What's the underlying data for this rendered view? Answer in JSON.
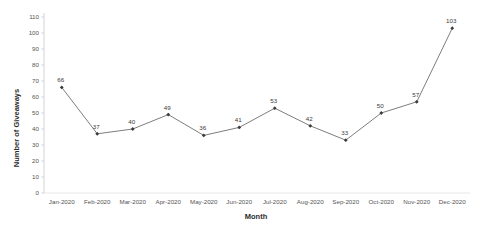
{
  "chart_data": {
    "type": "line",
    "title": "",
    "xlabel": "Month",
    "ylabel": "Number of Giveaways",
    "categories": [
      "Jan-2020",
      "Feb-2020",
      "Mar-2020",
      "Apr-2020",
      "May-2020",
      "Jun-2020",
      "Jul-2020",
      "Aug-2020",
      "Sep-2020",
      "Oct-2020",
      "Nov-2020",
      "Dec-2020"
    ],
    "values": [
      66,
      37,
      40,
      49,
      36,
      41,
      53,
      42,
      33,
      50,
      57,
      103
    ],
    "point_labels": [
      "66",
      "37",
      "40",
      "49",
      "36",
      "41",
      "53",
      "42",
      "33",
      "50",
      "57",
      "103"
    ],
    "ylim": [
      0,
      110
    ],
    "ytick_step": 10,
    "ytick_labels": [
      "0",
      "10",
      "20",
      "30",
      "40",
      "50",
      "60",
      "70",
      "80",
      "90",
      "100",
      "110"
    ],
    "grid": false,
    "legend": "none",
    "series": [
      {
        "name": "Number of Giveaways",
        "values": [
          66,
          37,
          40,
          49,
          36,
          41,
          53,
          42,
          33,
          50,
          57,
          103
        ],
        "line_color": "#6e6e6e",
        "marker_color": "#3a3a3a",
        "marker": "diamond"
      }
    ]
  },
  "colors": {
    "background": "#ffffff",
    "line": "#6e6e6e",
    "marker": "#3a3a3a",
    "axis": "#c8c8c8",
    "text": "#555555",
    "title_text": "#2b2b2b"
  }
}
